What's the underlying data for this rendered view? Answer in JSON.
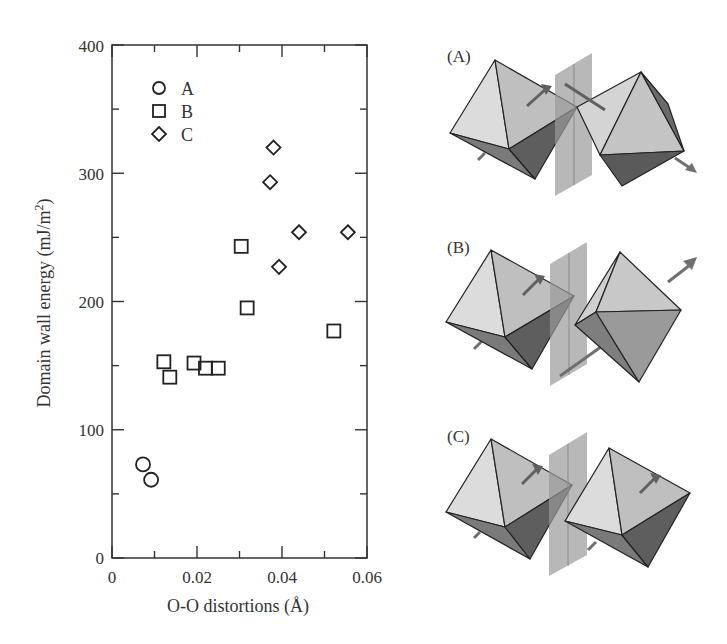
{
  "chart_data": {
    "type": "scatter",
    "title": "",
    "xlabel": "O-O distortions (Å)",
    "ylabel": "Domain wall energy (mJ/m²)",
    "ylabel_main": "Domain wall energy (mJ/m",
    "ylabel_sup": "2",
    "ylabel_close": ")",
    "xlim": [
      0,
      0.06
    ],
    "ylim": [
      0,
      400
    ],
    "xticks": [
      "0",
      "0.02",
      "0.04",
      "0.06"
    ],
    "yticks": [
      "0",
      "100",
      "200",
      "300",
      "400"
    ],
    "grid": false,
    "legend_position": "upper-left",
    "series": [
      {
        "name": "A",
        "marker": "circle",
        "x": [
          0.0073,
          0.0092
        ],
        "y": [
          73,
          61
        ]
      },
      {
        "name": "B",
        "marker": "square",
        "x": [
          0.0122,
          0.0136,
          0.0193,
          0.022,
          0.025,
          0.0304,
          0.0318,
          0.0522
        ],
        "y": [
          153,
          141,
          152,
          148,
          148,
          243,
          195,
          177
        ]
      },
      {
        "name": "C",
        "marker": "diamond",
        "x": [
          0.038,
          0.0372,
          0.044,
          0.0555,
          0.0393
        ],
        "y": [
          320,
          293,
          254,
          254,
          227
        ]
      }
    ]
  },
  "panels": [
    {
      "label": "(A)"
    },
    {
      "label": "(B)"
    },
    {
      "label": "(C)"
    }
  ],
  "colors": {
    "axis": "#333333",
    "marker": "#222222",
    "face_light": "#d9d9d9",
    "face_mid": "#bdbdbd",
    "face_dark": "#6e6e6e",
    "plane": "#a8a8a8",
    "arrow": "#707070"
  }
}
